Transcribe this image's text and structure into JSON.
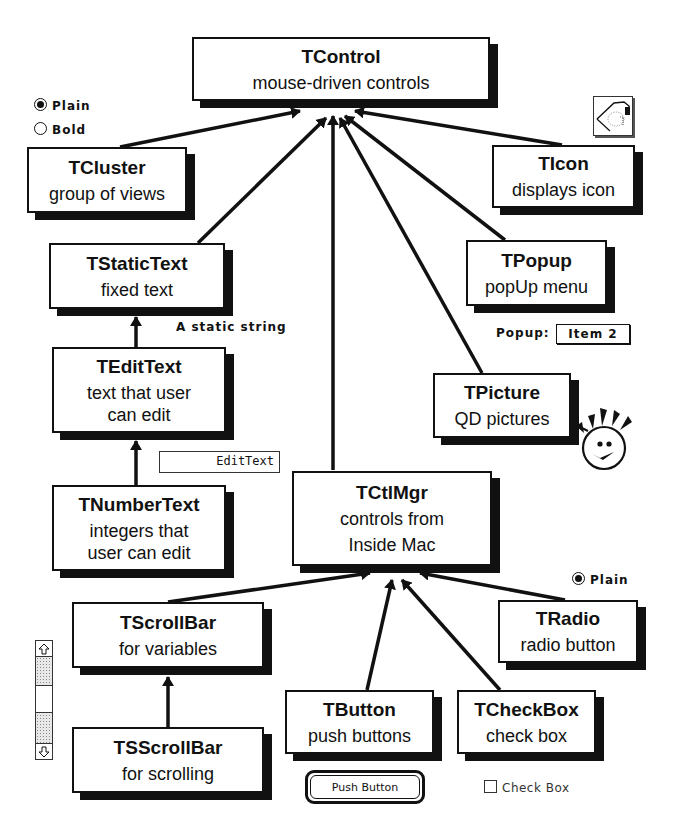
{
  "diagram": {
    "nodes": {
      "tcontrol": {
        "title": "TControl",
        "desc": [
          "mouse-driven controls"
        ]
      },
      "tcluster": {
        "title": "TCluster",
        "desc": [
          "group of views"
        ]
      },
      "ticon": {
        "title": "TIcon",
        "desc": [
          "displays icon"
        ]
      },
      "tstatictext": {
        "title": "TStaticText",
        "desc": [
          "fixed text"
        ]
      },
      "tpopup": {
        "title": "TPopup",
        "desc": [
          "popUp menu"
        ]
      },
      "tedittext": {
        "title": "TEditText",
        "desc": [
          "text that user",
          "can edit"
        ]
      },
      "tpicture": {
        "title": "TPicture",
        "desc": [
          "QD pictures"
        ]
      },
      "tnumbertext": {
        "title": "TNumberText",
        "desc": [
          "integers that",
          "user can edit"
        ]
      },
      "tctlmgr": {
        "title": "TCtlMgr",
        "desc": [
          "controls from",
          "Inside Mac"
        ]
      },
      "tscrollbar": {
        "title": "TScrollBar",
        "desc": [
          "for variables"
        ]
      },
      "tradio": {
        "title": "TRadio",
        "desc": [
          "radio button"
        ]
      },
      "tbutton": {
        "title": "TButton",
        "desc": [
          "push buttons"
        ]
      },
      "tcheckbox": {
        "title": "TCheckBox",
        "desc": [
          "check box"
        ]
      },
      "tsscrollbar": {
        "title": "TSScrollBar",
        "desc": [
          "for scrolling"
        ]
      }
    },
    "edges": [
      {
        "from": "tcluster",
        "to": "tcontrol"
      },
      {
        "from": "tstatictext",
        "to": "tcontrol"
      },
      {
        "from": "tctlmgr",
        "to": "tcontrol"
      },
      {
        "from": "tpicture",
        "to": "tcontrol"
      },
      {
        "from": "tpopup",
        "to": "tcontrol"
      },
      {
        "from": "ticon",
        "to": "tcontrol"
      },
      {
        "from": "tedittext",
        "to": "tstatictext"
      },
      {
        "from": "tnumbertext",
        "to": "tedittext"
      },
      {
        "from": "tscrollbar",
        "to": "tctlmgr"
      },
      {
        "from": "tbutton",
        "to": "tctlmgr"
      },
      {
        "from": "tcheckbox",
        "to": "tctlmgr"
      },
      {
        "from": "tradio",
        "to": "tctlmgr"
      },
      {
        "from": "tsscrollbar",
        "to": "tscrollbar"
      }
    ]
  },
  "samples": {
    "cluster_radios": [
      {
        "label": "Plain",
        "selected": true
      },
      {
        "label": "Bold",
        "selected": false
      }
    ],
    "static_string": "A static string",
    "edit_text_value": "EditText",
    "popup": {
      "label": "Popup:",
      "value": "Item 2"
    },
    "radio": {
      "label": "Plain",
      "selected": true
    },
    "push_button": "Push Button",
    "check_box": {
      "label": "Check Box",
      "checked": false
    },
    "icon": "hand-drawing-icon",
    "picture": "smiley-face-picture",
    "scrollbar": {
      "up": "up-arrow-icon",
      "down": "down-arrow-icon"
    }
  }
}
